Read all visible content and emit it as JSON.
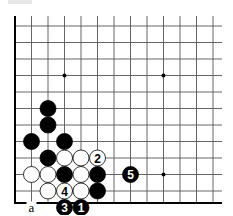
{
  "diagram": {
    "type": "go-board-diagram",
    "grid": {
      "x0": 15,
      "y0": 10,
      "spacing": 16.5,
      "cols": 13,
      "rows": 12,
      "right_extent": 222,
      "bottom_row_y": 203,
      "line_color": "#555555",
      "edge_color": "#000000",
      "left_edge": true,
      "bottom_edge": true
    },
    "hoshi": [
      {
        "col": 3,
        "row": 3
      },
      {
        "col": 9,
        "row": 3
      },
      {
        "col": 9,
        "row": 9
      }
    ],
    "stones": [
      {
        "color": "black",
        "col": 2,
        "row": 5,
        "label": ""
      },
      {
        "color": "black",
        "col": 2,
        "row": 6,
        "label": ""
      },
      {
        "color": "black",
        "col": 1,
        "row": 7,
        "label": ""
      },
      {
        "color": "black",
        "col": 3,
        "row": 7,
        "label": ""
      },
      {
        "color": "black",
        "col": 2,
        "row": 8,
        "label": ""
      },
      {
        "color": "white",
        "col": 3,
        "row": 8,
        "label": ""
      },
      {
        "color": "white",
        "col": 4,
        "row": 8,
        "label": ""
      },
      {
        "color": "white",
        "col": 5,
        "row": 8,
        "label": "2"
      },
      {
        "color": "white",
        "col": 1,
        "row": 9,
        "label": ""
      },
      {
        "color": "white",
        "col": 2,
        "row": 9,
        "label": ""
      },
      {
        "color": "black",
        "col": 3,
        "row": 9,
        "label": ""
      },
      {
        "color": "white",
        "col": 4,
        "row": 9,
        "label": ""
      },
      {
        "color": "black",
        "col": 5,
        "row": 9,
        "label": ""
      },
      {
        "color": "black",
        "col": 7,
        "row": 9,
        "label": "5"
      },
      {
        "color": "white",
        "col": 2,
        "row": 10,
        "label": ""
      },
      {
        "color": "white",
        "col": 3,
        "row": 10,
        "label": "4"
      },
      {
        "color": "white",
        "col": 4,
        "row": 10,
        "label": ""
      },
      {
        "color": "black",
        "col": 5,
        "row": 10,
        "label": ""
      },
      {
        "color": "black",
        "col": 3,
        "row": 11,
        "label": "3"
      },
      {
        "color": "black",
        "col": 4,
        "row": 11,
        "label": "1"
      }
    ],
    "markers": [
      {
        "col": 1,
        "row": 11,
        "text": "a"
      }
    ]
  }
}
